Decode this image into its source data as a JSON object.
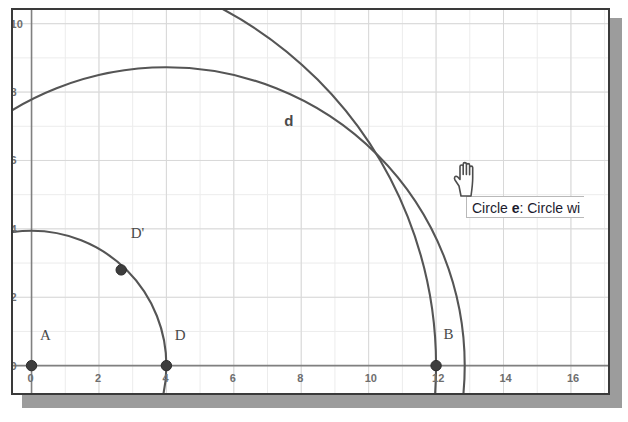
{
  "app": {
    "kind": "geometry-applet",
    "frame_border_color": "#3a3a3a",
    "shadow_color": "#9c9c9c",
    "background_color": "#ffffff",
    "grid_color": "#d8d8d8",
    "axis_color": "#808080",
    "curve_color": "#555555",
    "point_color": "#3d3d3d",
    "label_color": "#4a4a4a"
  },
  "tooltip": {
    "prefix": "Circle ",
    "object_name": "e",
    "suffix": ": Circle wi",
    "full_text": "Circle e: Circle wi",
    "truncated": true
  },
  "cursor": {
    "type": "pointing-hand-cursor",
    "x": 450,
    "y": 158
  },
  "chart_data": {
    "type": "scatter",
    "title": "",
    "xlabel": "",
    "ylabel": "",
    "xlim": [
      -0.55,
      17.1
    ],
    "ylim": [
      -0.8,
      10.4
    ],
    "grid": true,
    "legend_position": "none",
    "x_ticks": [
      0,
      2,
      4,
      6,
      8,
      10,
      12,
      14,
      16
    ],
    "x_tick_labels": [
      "0",
      "2",
      "4",
      "6",
      "8",
      "10",
      "12",
      "14",
      "16"
    ],
    "y_ticks": [
      0,
      2,
      4,
      6,
      8,
      10
    ],
    "y_tick_labels": [
      "0",
      "2",
      "4",
      "6",
      "8",
      "10"
    ],
    "minor_grid_step": 1,
    "points": [
      {
        "name": "A",
        "x": 0,
        "y": 0,
        "label_dx": 0.25,
        "label_dy": 0.75
      },
      {
        "name": "D",
        "x": 4,
        "y": 0,
        "label_dx": 0.25,
        "label_dy": 0.75
      },
      {
        "name": "B",
        "x": 12,
        "y": 0,
        "label_dx": 0.22,
        "label_dy": 0.78
      },
      {
        "name": "D'",
        "x": 2.66,
        "y": 2.8,
        "label_dx": 0.28,
        "label_dy": 0.92
      }
    ],
    "circles": [
      {
        "name": "",
        "cx": 0,
        "cy": 0,
        "r": 4,
        "label_x": null,
        "label_y": null
      },
      {
        "name": "d",
        "cx": 0,
        "cy": 0,
        "r": 12,
        "label_x": 7.5,
        "label_y": 7.0
      },
      {
        "name": "e",
        "cx": 4,
        "cy": 0,
        "r": 8.85,
        "label_x": null,
        "label_y": null
      }
    ],
    "axis_labels_visible": true
  }
}
